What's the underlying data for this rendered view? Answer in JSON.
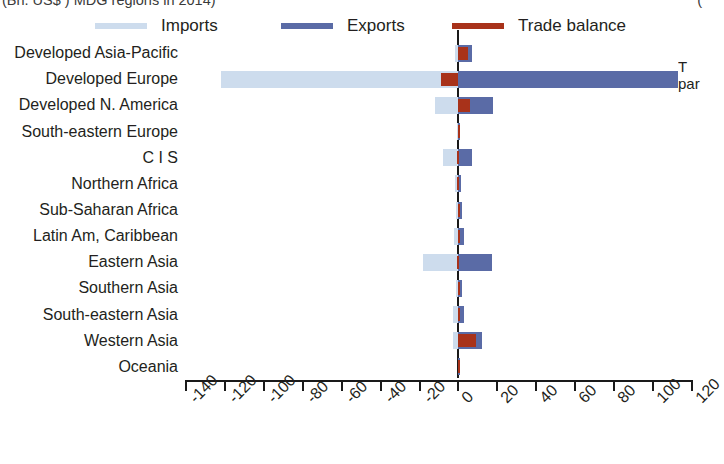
{
  "title": {
    "left_clipped": "(Bn. US$ ) MDG regions in 2014)",
    "right_clipped": "("
  },
  "legend": {
    "items": [
      {
        "label": "Imports",
        "color": "#cddced",
        "name": "legend-imports"
      },
      {
        "label": "Exports",
        "color": "#5a6ba6",
        "name": "legend-exports"
      },
      {
        "label": "Trade balance",
        "color": "#a8321a",
        "name": "legend-balance"
      }
    ]
  },
  "side_note": {
    "line1": "T",
    "line2": "par"
  },
  "chart_data": {
    "type": "bar",
    "orientation": "horizontal",
    "title": "(Bn. US$ ) MDG regions in 2014)",
    "xlabel": "",
    "ylabel": "",
    "xlim": [
      -140,
      120
    ],
    "grid": false,
    "legend_position": "top",
    "xticks": [
      -140,
      -120,
      -100,
      -80,
      -60,
      -40,
      -20,
      0,
      20,
      40,
      60,
      80,
      100,
      120
    ],
    "xticklabels": [
      "-140",
      "-120",
      "-100",
      "-80",
      "-60",
      "-40",
      "-20",
      "0",
      "20",
      "40",
      "60",
      "80",
      "100",
      "120"
    ],
    "categories": [
      "Developed Asia-Pacific",
      "Developed Europe",
      "Developed N. America",
      "South-eastern Europe",
      "C I S",
      "Northern Africa",
      "Sub-Saharan Africa",
      "Latin Am, Caribbean",
      "Eastern Asia",
      "Southern Asia",
      "South-eastern Asia",
      "Western Asia",
      "Oceania"
    ],
    "series": [
      {
        "name": "Imports",
        "color": "#cddced",
        "values": [
          -2,
          -122,
          -12,
          -0.5,
          -8,
          -2,
          -1.5,
          -2.5,
          -18,
          -1.5,
          -3,
          -3,
          -0.3
        ]
      },
      {
        "name": "Exports",
        "color": "#5a6ba6",
        "values": [
          7,
          113,
          18,
          0.5,
          7,
          1.5,
          2,
          3,
          17,
          2,
          3,
          12,
          0.3
        ]
      },
      {
        "name": "Trade balance",
        "color": "#a8321a",
        "values": [
          5,
          -9,
          6,
          0.2,
          -1,
          -0.5,
          0.5,
          0.5,
          -1,
          0.5,
          0.5,
          9,
          0.1
        ]
      }
    ]
  }
}
